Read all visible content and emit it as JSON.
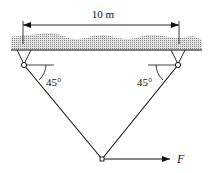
{
  "diagram": {
    "dimension_label": "10 m",
    "left_angle_label": "45°",
    "right_angle_label": "45°",
    "force_label": "F",
    "colors": {
      "ink": "#111111",
      "ceiling_fill": "#c8c8c8"
    }
  }
}
